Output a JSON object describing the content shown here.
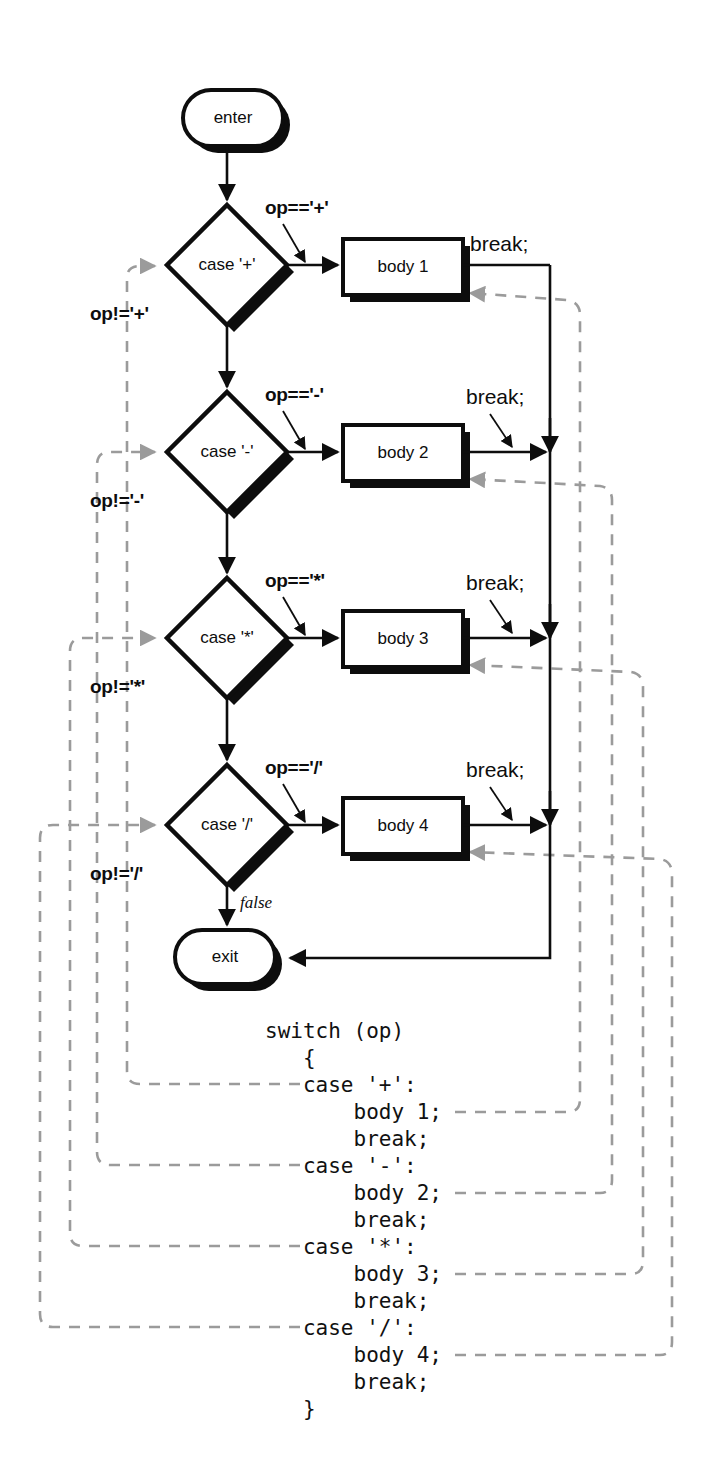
{
  "diagram": {
    "colors": {
      "ink": "#0d0d0d",
      "dashed": "#9b9b9b",
      "background": "#ffffff"
    },
    "nodes": {
      "enter": "enter",
      "exit": "exit"
    },
    "false_label": "false",
    "rows": [
      {
        "case_label": "case '+'",
        "true_label": "op=='+'",
        "false_label": "op!='+'",
        "body_label": "body 1",
        "break_label": "break;"
      },
      {
        "case_label": "case '-'",
        "true_label": "op=='-'",
        "false_label": "op!='-'",
        "body_label": "body 2",
        "break_label": "break;"
      },
      {
        "case_label": "case '*'",
        "true_label": "op=='*'",
        "false_label": "op!='*'",
        "body_label": "body 3",
        "break_label": "break;"
      },
      {
        "case_label": "case '/'",
        "true_label": "op=='/'",
        "false_label": "op!='/'",
        "body_label": "body 4",
        "break_label": "break;"
      }
    ]
  },
  "code_listing": {
    "lines": [
      "switch (op)",
      "   {",
      "   case '+':",
      "       body 1;",
      "       break;",
      "   case '-':",
      "       body 2;",
      "       break;",
      "   case '*':",
      "       body 3;",
      "       break;",
      "   case '/':",
      "       body 4;",
      "       break;",
      "   }"
    ]
  }
}
